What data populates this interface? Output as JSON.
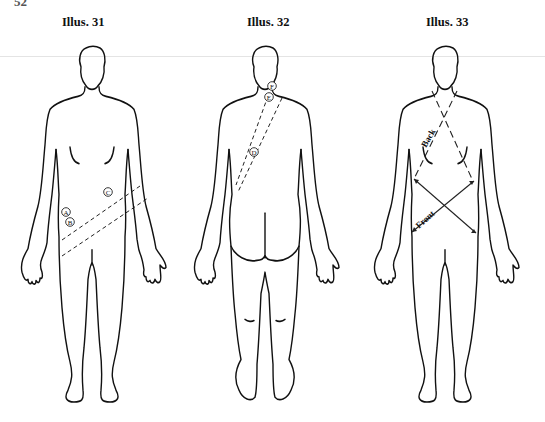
{
  "page": {
    "number": "52"
  },
  "illustrations": [
    {
      "title": "Illus. 31",
      "view": "front",
      "markers": [
        "A",
        "B",
        "C"
      ]
    },
    {
      "title": "Illus. 32",
      "view": "back",
      "markers": [
        "F",
        "E",
        "D"
      ]
    },
    {
      "title": "Illus. 33",
      "view": "front",
      "labels": {
        "back": "Back",
        "front": "Front"
      }
    }
  ]
}
